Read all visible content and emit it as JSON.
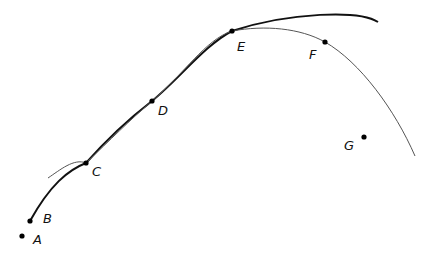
{
  "diagram": {
    "type": "curves-with-points",
    "colors": {
      "thick_curve": "#111111",
      "thin_curve": "#555555",
      "point": "#000000"
    },
    "curves": [
      {
        "name": "thick-curve",
        "description": "bold arc from B through C, D, E rising then flattening to the right"
      },
      {
        "name": "thin-curve",
        "description": "thin arc starting near C, through E and F, dropping down to the right"
      }
    ],
    "points": [
      {
        "label": "A",
        "x": 22,
        "y": 236,
        "label_x": 33,
        "label_y": 233
      },
      {
        "label": "B",
        "x": 30,
        "y": 221,
        "label_x": 43,
        "label_y": 212
      },
      {
        "label": "C",
        "x": 86,
        "y": 163,
        "label_x": 92,
        "label_y": 165
      },
      {
        "label": "D",
        "x": 152,
        "y": 101,
        "label_x": 158,
        "label_y": 104
      },
      {
        "label": "E",
        "x": 232,
        "y": 31,
        "label_x": 237,
        "label_y": 40
      },
      {
        "label": "F",
        "x": 325,
        "y": 42,
        "label_x": 309,
        "label_y": 48
      },
      {
        "label": "G",
        "x": 364,
        "y": 137,
        "label_x": 344,
        "label_y": 139
      }
    ]
  }
}
